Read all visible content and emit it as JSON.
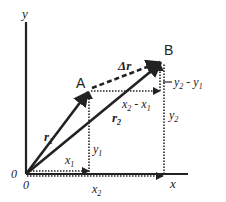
{
  "diagram": {
    "axes": {
      "x_label": "x",
      "y_label": "y",
      "origin_labels": [
        "0",
        "0"
      ]
    },
    "points": [
      {
        "name": "A",
        "label": "A"
      },
      {
        "name": "B",
        "label": "B"
      }
    ],
    "vectors": [
      {
        "name": "r1",
        "base": "r",
        "sub": "1",
        "style": "solid"
      },
      {
        "name": "r2",
        "base": "r",
        "sub": "2",
        "style": "solid"
      },
      {
        "name": "delta-r",
        "label": "Δr",
        "style": "dashed"
      }
    ],
    "components": {
      "x1": {
        "base": "x",
        "sub": "1"
      },
      "x2": {
        "base": "x",
        "sub": "2"
      },
      "y1": {
        "base": "y",
        "sub": "1"
      },
      "y2": {
        "base": "y",
        "sub": "2"
      },
      "dx": {
        "a": "x",
        "a_sub": "2",
        "op": " - ",
        "b": "x",
        "b_sub": "1"
      },
      "dy": {
        "a": "y",
        "a_sub": "2",
        "op": " - ",
        "b": "y",
        "b_sub": "1"
      }
    },
    "colors": {
      "ink": "#222222",
      "background": "#ffffff"
    }
  }
}
